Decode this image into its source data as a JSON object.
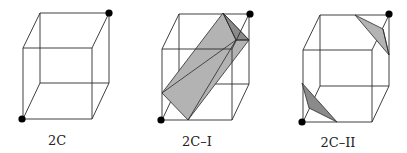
{
  "figures": [
    {
      "id": "2C",
      "label": "2C",
      "label_x": 57,
      "label_y": 145
    },
    {
      "id": "2C-I",
      "label": "2C–I",
      "label_x": 197,
      "label_y": 146
    },
    {
      "id": "2C-II",
      "label": "2C–II",
      "label_x": 338,
      "label_y": 147
    }
  ],
  "colors": {
    "edge": "#2a2a2a",
    "shade_light": "#b3b3b3",
    "shade_dark": "#8a8a8a",
    "vertex_dot": "#000000",
    "background": "#ffffff"
  }
}
